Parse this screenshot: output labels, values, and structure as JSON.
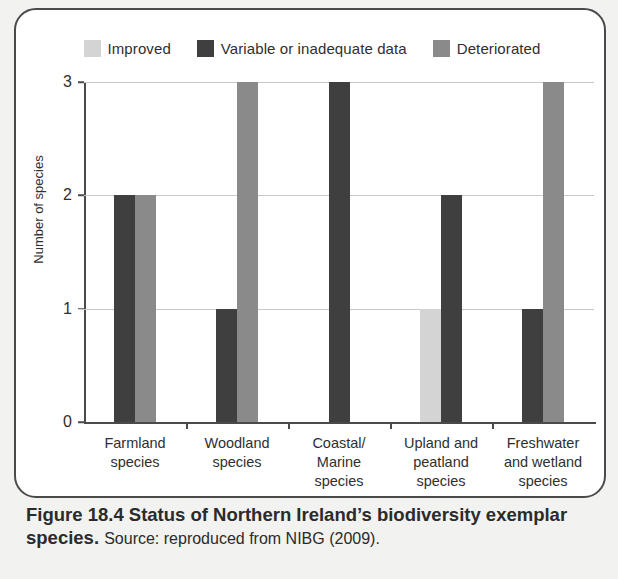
{
  "legend": {
    "items": [
      {
        "label": "Improved",
        "color": "#d4d4d4"
      },
      {
        "label": "Variable or inadequate data",
        "color": "#3f3f3f"
      },
      {
        "label": "Deteriorated",
        "color": "#8a8a8a"
      }
    ]
  },
  "caption": {
    "title": "Figure 18.4 Status of Northern Ireland’s biodiversity exemplar species.",
    "source": "Source: reproduced from NIBG (2009)."
  },
  "chart_data": {
    "type": "bar",
    "title": "Status of Northern Ireland’s biodiversity exemplar species",
    "xlabel": "",
    "ylabel": "Number of species",
    "ylim": [
      0,
      3
    ],
    "yticks": [
      "0",
      "1",
      "2",
      "3"
    ],
    "grid": true,
    "legend_position": "top-center",
    "categories": [
      "Farmland species",
      "Woodland species",
      "Coastal/ Marine species",
      "Upland and peatland species",
      "Freshwater and wetland species"
    ],
    "category_lines": [
      [
        "Farmland",
        "species"
      ],
      [
        "Woodland",
        "species"
      ],
      [
        "Coastal/",
        "Marine",
        "species"
      ],
      [
        "Upland and",
        "peatland",
        "species"
      ],
      [
        "Freshwater",
        "and wetland",
        "species"
      ]
    ],
    "series": [
      {
        "name": "Improved",
        "color": "#d4d4d4",
        "values": [
          0,
          0,
          0,
          1,
          0
        ]
      },
      {
        "name": "Variable or inadequate data",
        "color": "#3f3f3f",
        "values": [
          2,
          1,
          3,
          2,
          1
        ]
      },
      {
        "name": "Deteriorated",
        "color": "#8a8a8a",
        "values": [
          2,
          3,
          0,
          0,
          3
        ]
      }
    ]
  }
}
